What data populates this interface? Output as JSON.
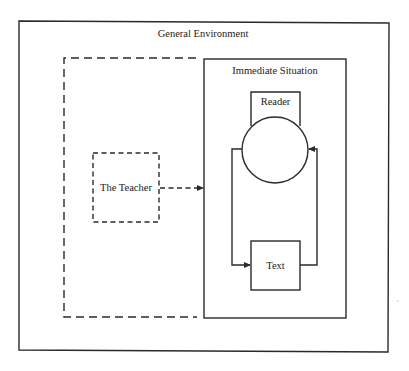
{
  "diagram": {
    "general_environment": {
      "label": "General Environment"
    },
    "immediate_situation": {
      "label": "Immediate Situation"
    },
    "reader": {
      "label": "Reader"
    },
    "text": {
      "label": "Text"
    },
    "teacher": {
      "label": "The Teacher"
    },
    "edges": [
      {
        "from": "The Teacher",
        "to": "Immediate Situation",
        "style": "dashed",
        "arrow": true
      },
      {
        "from": "Reader",
        "to": "Text",
        "style": "solid",
        "arrow": true,
        "path": "left loop"
      },
      {
        "from": "Text",
        "to": "Reader",
        "style": "solid",
        "arrow": true,
        "path": "right loop"
      }
    ]
  }
}
